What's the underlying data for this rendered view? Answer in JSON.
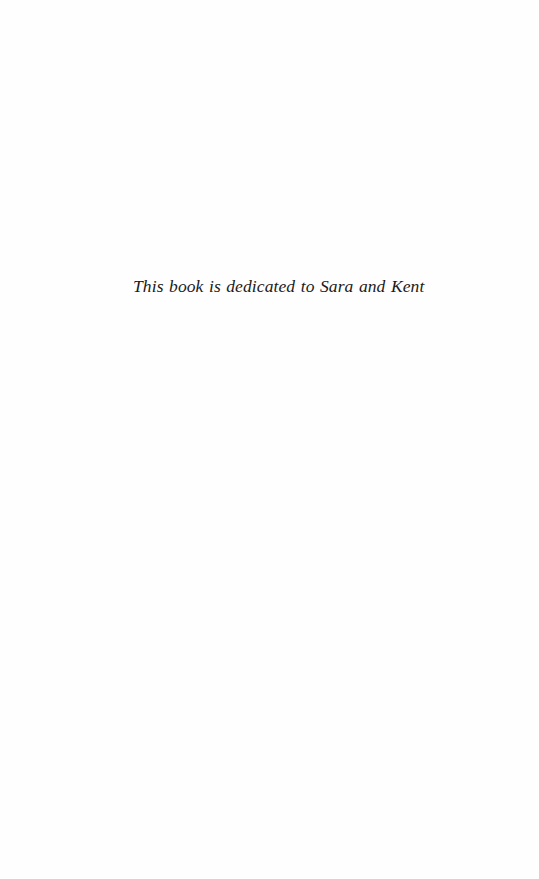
{
  "page": {
    "dedication": "This book is dedicated to Sara and Kent"
  }
}
